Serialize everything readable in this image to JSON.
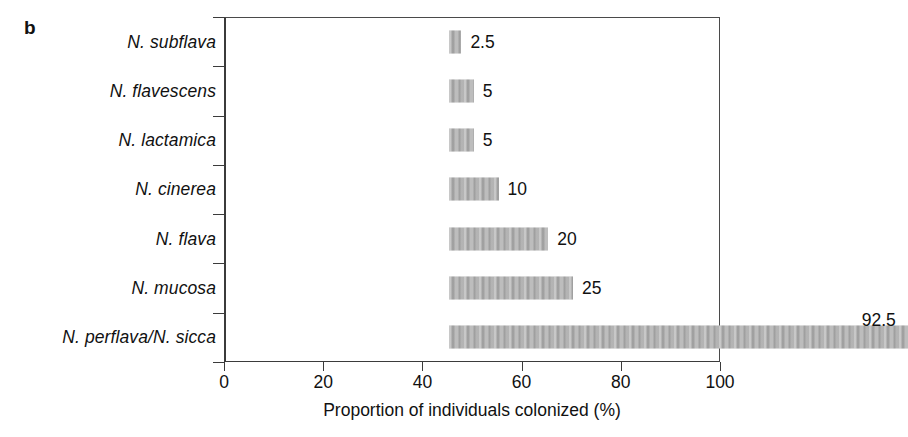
{
  "panel": {
    "letter": "b"
  },
  "chart_data": {
    "type": "bar",
    "orientation": "horizontal",
    "title": "",
    "subtitle": "",
    "xlabel": "Proportion of individuals colonized (%)",
    "ylabel": "",
    "xlim": [
      0,
      100
    ],
    "xticks": [
      0,
      20,
      40,
      60,
      80,
      100
    ],
    "xtick_labels": [
      "0",
      "20",
      "40",
      "60",
      "80",
      "100"
    ],
    "grid": false,
    "legend": null,
    "bar_color": "#ababab",
    "axis_color": "#3b3b3b",
    "categories": [
      "N. subflava",
      "N. flavescens",
      "N. lactamica",
      "N. cinerea",
      "N. flava",
      "N. mucosa",
      "N. perflava/N. sicca"
    ],
    "values": [
      2.5,
      5,
      5,
      10,
      20,
      25,
      92.5
    ],
    "value_labels": [
      "2.5",
      "5",
      "5",
      "10",
      "20",
      "25",
      "92.5"
    ],
    "value_label_position": [
      "right",
      "right",
      "right",
      "right",
      "right",
      "right",
      "above"
    ]
  }
}
